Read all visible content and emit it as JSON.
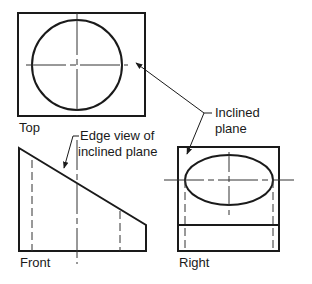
{
  "diagram": {
    "type": "orthographic-projection",
    "colors": {
      "object_line": "#1a1a1a",
      "hidden_line": "#333333",
      "center_line": "#333333",
      "leader_line": "#333333",
      "background": "#ffffff"
    },
    "views": {
      "top": {
        "label": "Top",
        "outline": {
          "x": 18,
          "y": 13,
          "width": 127,
          "height": 103
        },
        "circle": {
          "cx": 77,
          "cy": 65,
          "r": 45
        },
        "center_lines": {
          "vertical_x": 77,
          "horizontal_y": 65
        }
      },
      "front": {
        "label": "Front",
        "outline_points": [
          [
            19,
            148
          ],
          [
            146,
            225
          ],
          [
            146,
            251
          ],
          [
            19,
            251
          ]
        ],
        "hidden_lines_x": [
          32,
          120
        ],
        "center_line_x": 77
      },
      "right": {
        "label": "Right",
        "outline": {
          "x": 178,
          "y": 147,
          "width": 101,
          "height": 104
        },
        "divider_y": 225,
        "ellipse": {
          "cx": 229,
          "cy": 180,
          "rx": 44,
          "ry": 25
        },
        "hidden_lines_x": [
          185,
          273
        ],
        "center_lines": {
          "vertical_x": 229,
          "horizontal_y": 180
        }
      }
    },
    "annotations": [
      {
        "id": "edge-view",
        "lines": [
          "Edge view of",
          "inclined plane"
        ]
      },
      {
        "id": "inclined-plane",
        "lines": [
          "Inclined",
          "plane"
        ]
      }
    ]
  }
}
